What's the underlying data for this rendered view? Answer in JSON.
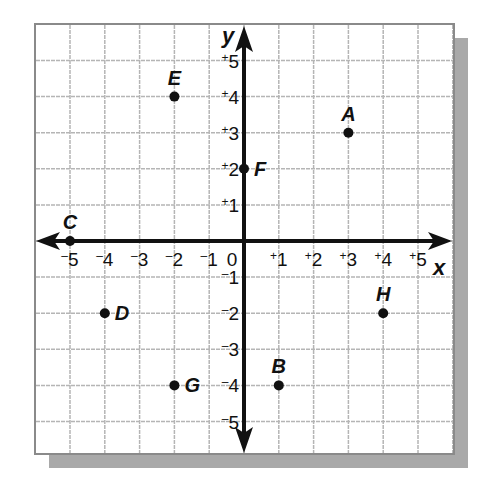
{
  "chart_data": {
    "type": "scatter",
    "title": "",
    "xlabel": "x",
    "ylabel": "y",
    "xlim": [
      -5,
      5
    ],
    "ylim": [
      -5,
      5
    ],
    "grid": true,
    "x_ticks": [
      "-5",
      "-4",
      "-3",
      "-2",
      "-1",
      "0",
      "+1",
      "+2",
      "+3",
      "+4",
      "+5"
    ],
    "y_ticks": [
      "+5",
      "+4",
      "+3",
      "+2",
      "+1",
      "-1",
      "-2",
      "-3",
      "-4",
      "-5"
    ],
    "points": [
      {
        "label": "A",
        "x": 3,
        "y": 3
      },
      {
        "label": "B",
        "x": 1,
        "y": -4
      },
      {
        "label": "C",
        "x": -5,
        "y": 0
      },
      {
        "label": "D",
        "x": -4,
        "y": -2
      },
      {
        "label": "E",
        "x": -2,
        "y": 4
      },
      {
        "label": "F",
        "x": 0,
        "y": 2
      },
      {
        "label": "G",
        "x": -2,
        "y": -4
      },
      {
        "label": "H",
        "x": 4,
        "y": -2
      }
    ]
  },
  "colors": {
    "grid": "#b5b5b5",
    "border": "#8a8a8a",
    "shadow": "#a9a9a9",
    "axis": "#111111",
    "point": "#111111"
  }
}
